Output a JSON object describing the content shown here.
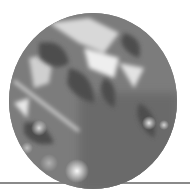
{
  "image": {
    "subject": "grayscale photo of leaves with sunlight, circular crop",
    "shape": "circle",
    "tone": "grayscale",
    "colors": {
      "background": "#ffffff",
      "rule": "#8a8a8a",
      "photo_base": "#7a7a7a",
      "highlight": "#f2f2f2",
      "shadow": "#555555"
    }
  }
}
